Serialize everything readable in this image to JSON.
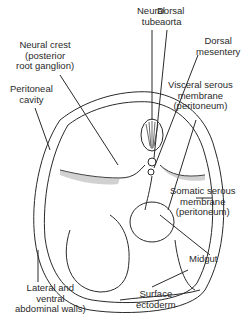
{
  "labels": {
    "neural_tube": "Neural\ntube",
    "dorsal_aorta": "Dorsal\naorta",
    "neural_crest": "Neural crest\n(posterior\nroot ganglion)",
    "dorsal_mesentery": "Dorsal\nmesentery",
    "peritoneal_cavity": "Peritoneal\ncavity",
    "visceral_serous": "Visceral serous\nmembrane\n(peritoneum)",
    "somatic_serous": "Somatic serous\nmembrane\n(peritoneum)",
    "midgut": "Midgut",
    "lateral_ventral": "Lateral and\nventral\nabdominal walls)",
    "surface_ectoderm": "Surface\nectoderm"
  },
  "colors": {
    "line": "#2a2a2a",
    "shade": "#9a9a9a"
  }
}
